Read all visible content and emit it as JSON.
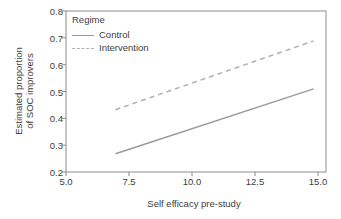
{
  "chart_data": {
    "type": "line",
    "title": "",
    "xlabel": "Self efficacy pre-study",
    "ylabel": "Estimated proportion\nof SOC improvers",
    "xlim": [
      5.0,
      15.5
    ],
    "ylim": [
      0.18,
      0.8
    ],
    "xticks": [
      "5.0",
      "7.5",
      "10.0",
      "12.5",
      "15.0"
    ],
    "xtick_values": [
      5.0,
      7.5,
      10.0,
      12.5,
      15.0
    ],
    "yticks": [
      "0.2",
      "0.3",
      "0.4",
      "0.5",
      "0.6",
      "0.7",
      "0.8"
    ],
    "ytick_values": [
      0.2,
      0.3,
      0.4,
      0.5,
      0.6,
      0.7,
      0.8
    ],
    "grid": false,
    "legend_position": "top-left-inside",
    "legend_title": "Regime",
    "series": [
      {
        "name": "Control",
        "style": "solid",
        "color": "#9a9a9a",
        "x": [
          7.0,
          15.0
        ],
        "values": [
          0.25,
          0.5
        ]
      },
      {
        "name": "Intervention",
        "style": "dashed",
        "color": "#b0b0b0",
        "x": [
          7.0,
          15.0
        ],
        "values": [
          0.42,
          0.685
        ]
      }
    ]
  },
  "legend": {
    "title": "Regime",
    "items": [
      {
        "label": "Control"
      },
      {
        "label": "Intervention"
      }
    ]
  },
  "axes": {
    "frame_color": "#8c8c8c",
    "text_color": "#3d3d3d"
  }
}
